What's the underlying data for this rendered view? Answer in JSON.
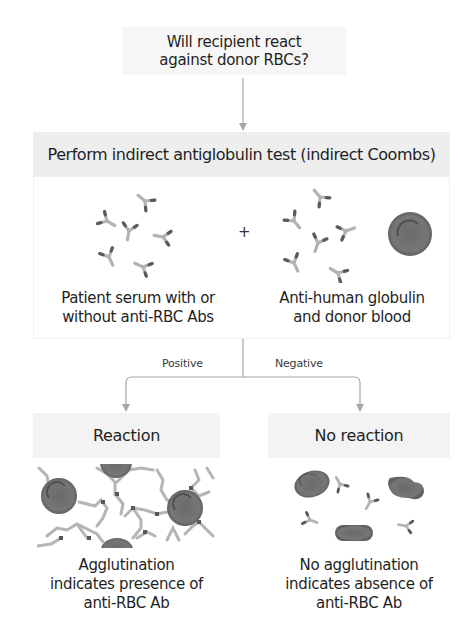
{
  "diagram": {
    "question": "Will recipient react against donor RBCs?",
    "test_title": "Perform indirect antiglobulin test (indirect Coombs)",
    "plus_sign": "+",
    "left_reagent": {
      "caption_line1": "Patient serum with or",
      "caption_line2": "without anti-RBC Abs",
      "icons": [
        "antibody-icon x6"
      ]
    },
    "right_reagent": {
      "caption_line1": "Anti-human globulin",
      "caption_line2": "and donor blood",
      "icons": [
        "antibody-icon x6",
        "red-blood-cell-icon"
      ]
    },
    "branches": {
      "positive_label": "Positive",
      "negative_label": "Negative"
    },
    "outcomes": [
      {
        "title": "Reaction",
        "caption_line1": "Agglutination",
        "caption_line2": "indicates presence of",
        "caption_line3": "anti-RBC Ab"
      },
      {
        "title": "No reaction",
        "caption_line1": "No agglutination",
        "caption_line2": "indicates absence of",
        "caption_line3": "anti-RBC Ab"
      }
    ],
    "colors": {
      "box_fill": "#eeeeee",
      "arrow": "#a0a0a0",
      "rbc": "#707070",
      "antibody": "#b5b5b5",
      "antibody_tip": "#555555"
    }
  }
}
